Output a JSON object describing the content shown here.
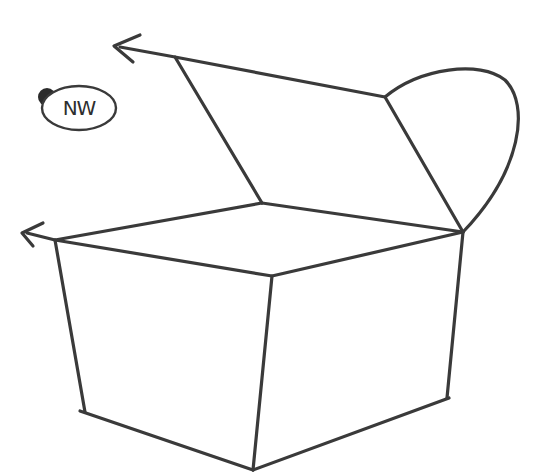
{
  "drawing": {
    "subject": "open box sketch",
    "style": "pencil",
    "stroke_color": "#3a3a3a",
    "background": "#ffffff"
  },
  "badge": {
    "label": "NW",
    "dot_color": "#2b2b2b"
  },
  "arrows": [
    {
      "name": "lid-arrow",
      "direction": "left"
    },
    {
      "name": "base-arrow",
      "direction": "left"
    }
  ]
}
